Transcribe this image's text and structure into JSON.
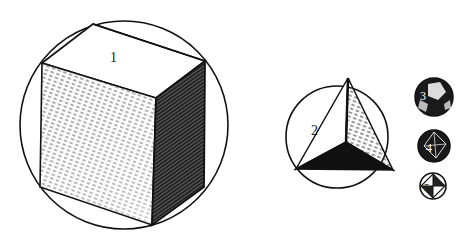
{
  "figure": {
    "solids": [
      {
        "label": "1",
        "shape": "cube"
      },
      {
        "label": "2",
        "shape": "tetrahedron"
      },
      {
        "label": "3",
        "shape": "dodecahedron"
      },
      {
        "label": "4",
        "shape": "icosahedron"
      },
      {
        "label": "5",
        "shape": "octahedron"
      }
    ]
  }
}
